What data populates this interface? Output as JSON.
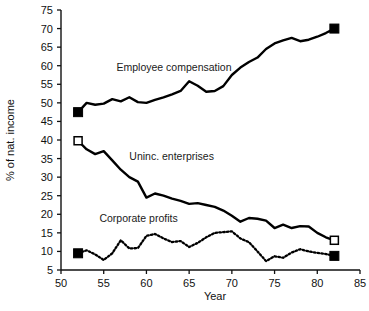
{
  "chart_data": {
    "type": "line",
    "title": "",
    "subtitle": "",
    "xlabel": "Year",
    "ylabel": "% of nat. income",
    "xlim": [
      50,
      85
    ],
    "ylim": [
      5,
      75
    ],
    "grid": false,
    "legend_position": "inline-annotations",
    "xticks": [
      "50",
      "55",
      "60",
      "65",
      "70",
      "75",
      "80",
      "85"
    ],
    "xtick_values": [
      50,
      55,
      60,
      65,
      70,
      75,
      80,
      85
    ],
    "yticks": [
      "5",
      "10",
      "15",
      "20",
      "25",
      "30",
      "35",
      "40",
      "45",
      "50",
      "55",
      "60",
      "65",
      "70",
      "75"
    ],
    "ytick_values": [
      5,
      10,
      15,
      20,
      25,
      30,
      35,
      40,
      45,
      50,
      55,
      60,
      65,
      70,
      75
    ],
    "series": [
      {
        "name": "Employee compensation",
        "style": "solid",
        "marker_start": "filled-square",
        "marker_end": "filled-square",
        "x": [
          52,
          53,
          54,
          55,
          56,
          57,
          58,
          59,
          60,
          61,
          62,
          63,
          64,
          65,
          66,
          67,
          68,
          69,
          70,
          71,
          72,
          73,
          74,
          75,
          76,
          77,
          78,
          79,
          80,
          81,
          82
        ],
        "values": [
          47.5,
          50.0,
          49.5,
          49.8,
          51.0,
          50.4,
          51.5,
          50.2,
          50.0,
          50.8,
          51.5,
          52.3,
          53.2,
          55.8,
          54.6,
          53.0,
          53.2,
          54.5,
          57.5,
          59.5,
          61.0,
          62.2,
          64.5,
          66.0,
          66.8,
          67.5,
          66.6,
          67.0,
          67.8,
          68.8,
          70.0
        ]
      },
      {
        "name": "Uninc. enterprises",
        "style": "solid",
        "marker_start": "hollow-square",
        "marker_end": "hollow-square",
        "x": [
          52,
          53,
          54,
          55,
          56,
          57,
          58,
          59,
          60,
          61,
          62,
          63,
          64,
          65,
          66,
          67,
          68,
          69,
          70,
          71,
          72,
          73,
          74,
          75,
          76,
          77,
          78,
          79,
          80,
          81,
          82
        ],
        "values": [
          39.8,
          37.5,
          36.2,
          37.0,
          34.5,
          32.0,
          30.0,
          28.8,
          24.5,
          25.6,
          25.0,
          24.2,
          23.6,
          22.8,
          23.0,
          22.5,
          22.0,
          21.0,
          19.6,
          18.0,
          19.0,
          18.8,
          18.3,
          16.3,
          17.2,
          16.3,
          16.8,
          16.7,
          15.0,
          13.8,
          13.0
        ]
      },
      {
        "name": "Corporate profits",
        "style": "dotted",
        "marker_start": "filled-square",
        "marker_end": "filled-square",
        "x": [
          52,
          53,
          54,
          55,
          56,
          57,
          58,
          59,
          60,
          61,
          62,
          63,
          64,
          65,
          66,
          67,
          68,
          69,
          70,
          71,
          72,
          73,
          74,
          75,
          76,
          77,
          78,
          79,
          80,
          81,
          82
        ],
        "values": [
          9.5,
          10.3,
          9.2,
          7.7,
          9.5,
          13.0,
          10.8,
          10.9,
          14.2,
          14.7,
          13.5,
          12.5,
          12.8,
          11.2,
          12.3,
          13.8,
          15.0,
          15.2,
          15.4,
          13.5,
          12.5,
          10.0,
          7.4,
          8.7,
          8.3,
          9.7,
          10.6,
          10.0,
          9.6,
          9.3,
          8.8
        ]
      }
    ],
    "annotations": [
      {
        "label": "Employee compensation",
        "x": 56.5,
        "y": 58.5
      },
      {
        "label": "Uninc. enterprises",
        "x": 58.0,
        "y": 34.5
      },
      {
        "label": "Corporate profits",
        "x": 54.5,
        "y": 17.8
      }
    ]
  }
}
